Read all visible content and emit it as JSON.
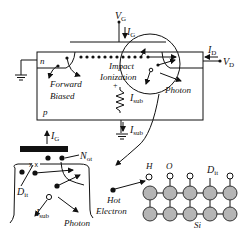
{
  "diagram": {
    "type": "MOSFET hot-carrier degradation mechanisms",
    "top_device": {
      "gate_voltage": {
        "main": "V",
        "sub": "G"
      },
      "gate_current": {
        "main": "I",
        "sub": "G"
      },
      "drain_current": {
        "main": "I",
        "sub": "D"
      },
      "drain_voltage": {
        "main": "V",
        "sub": "D"
      },
      "source_region": "n",
      "substrate_region": "p",
      "forward_biased_line1": "Forward",
      "forward_biased_line2": "Biased",
      "impact_line1": "Impact",
      "impact_line2": "Ionization",
      "photon": "Photon",
      "substrate_current": {
        "main": "I",
        "sub": "sub"
      },
      "substrate_current_lower": {
        "main": "I",
        "sub": "sub"
      },
      "plus_sign": "+"
    },
    "oxide_detail": {
      "gate_current": {
        "main": "I",
        "sub": "G"
      },
      "oxide_trap": {
        "main": "N",
        "sub": "ot"
      },
      "interface_trap": {
        "main": "D",
        "sub": "it"
      },
      "substrate_current": {
        "main": "I",
        "sub": "sub"
      },
      "photon": "Photon"
    },
    "lattice_detail": {
      "hot_electron_line1": "Hot",
      "hot_electron_line2": "Electron",
      "hydrogen": "H",
      "oxygen": "O",
      "interface_trap": {
        "main": "D",
        "sub": "it"
      },
      "silicon": "Si"
    },
    "colors": {
      "line": "#111111",
      "atom_fill": "#b5b5b5",
      "background": "#ffffff"
    }
  }
}
